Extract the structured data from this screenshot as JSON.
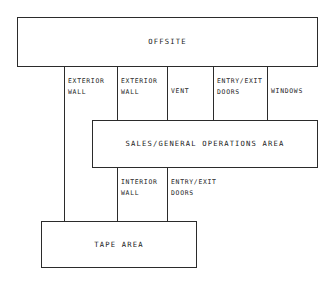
{
  "diagram": {
    "stroke_color": "#2b2b2b",
    "text_color": "#1c1c1c",
    "background_color": "#ffffff",
    "boxes": [
      {
        "id": "offsite",
        "label": "OFFSITE"
      },
      {
        "id": "sales",
        "label": "SALES/GENERAL OPERATIONS AREA"
      },
      {
        "id": "tape",
        "label": "TAPE AREA"
      }
    ],
    "upper_connectors": [
      {
        "id": "exterior-wall-1",
        "label": "EXTERIOR\nWALL"
      },
      {
        "id": "exterior-wall-2",
        "label": "EXTERIOR\nWALL"
      },
      {
        "id": "vent",
        "label": "VENT"
      },
      {
        "id": "entry-exit-doors-1",
        "label": "ENTRY/EXIT\nDOORS"
      },
      {
        "id": "windows",
        "label": "WINDOWS"
      }
    ],
    "lower_connectors": [
      {
        "id": "interior-wall",
        "label": "INTERIOR\nWALL"
      },
      {
        "id": "entry-exit-doors-2",
        "label": "ENTRY/EXIT\nDOORS"
      }
    ]
  }
}
